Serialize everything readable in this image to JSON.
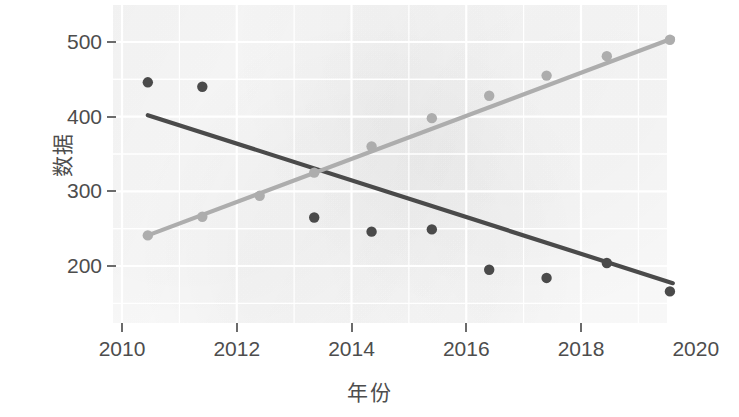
{
  "chart_data": {
    "type": "scatter",
    "title": "",
    "xlabel": "年份",
    "ylabel": "数据",
    "xlim": [
      2010.0,
      2020.0
    ],
    "ylim": [
      155,
      515
    ],
    "xticks": [
      2010,
      2012,
      2014,
      2016,
      2018,
      2020
    ],
    "xtick_labels": [
      "2010",
      "2012",
      "2014",
      "2016",
      "2018",
      "2020"
    ],
    "yticks": [
      200,
      300,
      400,
      500
    ],
    "ytick_labels": [
      "200",
      "300",
      "400",
      "500"
    ],
    "grid": "faint-white",
    "legend": "none",
    "panel_background": "#fbfbfb",
    "series": [
      {
        "name": "declining-series",
        "color": "#4a4a4a",
        "marker": "circle",
        "has_trendline": true,
        "trendline_color": "#4a4a4a",
        "trendline_endpoints": [
          [
            2010.45,
            402
          ],
          [
            2019.6,
            177
          ]
        ],
        "x": [
          2010.45,
          2011.4,
          2013.35,
          2014.35,
          2015.4,
          2016.4,
          2017.4,
          2018.45,
          2019.55
        ],
        "y": [
          446,
          440,
          265,
          246,
          249,
          195,
          184,
          204,
          166
        ]
      },
      {
        "name": "rising-series",
        "color": "#adadad",
        "marker": "circle",
        "has_trendline": true,
        "trendline_color": "#adadad",
        "trendline_endpoints": [
          [
            2010.45,
            241
          ],
          [
            2019.6,
            505
          ]
        ],
        "x": [
          2010.45,
          2011.4,
          2012.4,
          2013.35,
          2014.35,
          2015.4,
          2016.4,
          2017.4,
          2018.45,
          2019.55
        ],
        "y": [
          241,
          266,
          294,
          325,
          360,
          398,
          428,
          455,
          481,
          503
        ]
      }
    ]
  }
}
